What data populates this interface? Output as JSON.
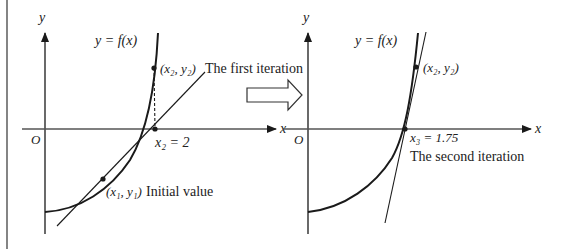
{
  "diagram": {
    "colors": {
      "stroke": "#1a1a1a",
      "axis": "#555555",
      "text": "#222222",
      "background": "#ffffff"
    },
    "left_panel": {
      "y_axis_label": "y",
      "x_axis_label": "x",
      "origin_label": "O",
      "curve_label": "y = f(x)",
      "point_top_label": "(x₂, y₂)",
      "point_top_caption": "The first iteration",
      "intercept_label": "x₂ = 2",
      "point_initial_label": "(x₁, y₁)",
      "point_initial_caption": "Initial value"
    },
    "transition_arrow": {
      "icon": "hollow-right-arrow"
    },
    "right_panel": {
      "y_axis_label": "y",
      "x_axis_label": "x",
      "origin_label": "O",
      "curve_label": "y = f(x)",
      "point_top_label": "(x₂, y₂)",
      "intercept_label": "x₃ = 1.75",
      "intercept_caption": "The second iteration"
    }
  }
}
